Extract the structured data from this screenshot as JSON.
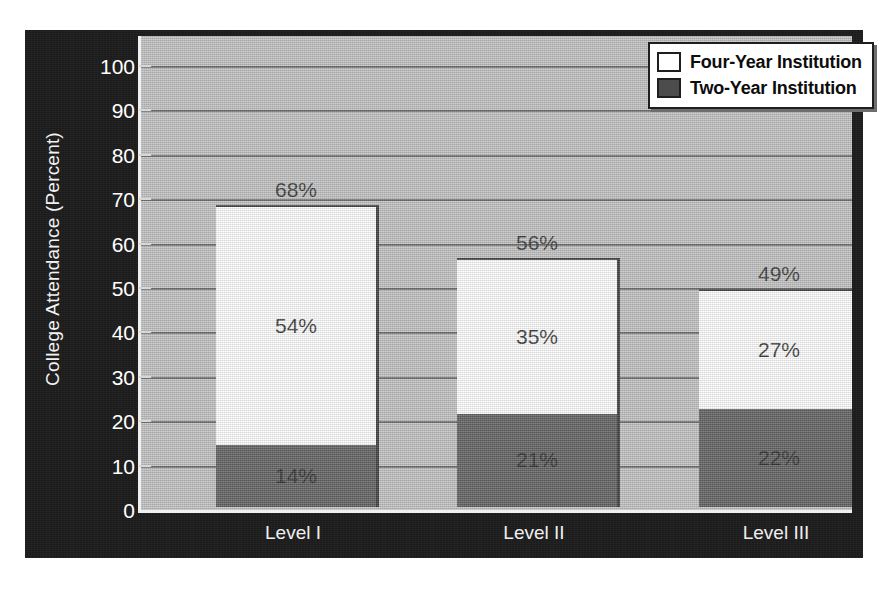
{
  "chart_data": {
    "type": "bar",
    "subtype": "stacked-bar",
    "title": "",
    "xlabel": "",
    "ylabel": "College Attendance (Percent)",
    "categories": [
      "Level I",
      "Level II",
      "Level III"
    ],
    "series": [
      {
        "name": "Two-Year Institution",
        "values": [
          14,
          21,
          22
        ],
        "color": "#4c4c4c",
        "stack_position": "bottom"
      },
      {
        "name": "Four-Year Institution",
        "values": [
          54,
          35,
          27
        ],
        "color": "#ffffff",
        "stack_position": "top"
      }
    ],
    "totals": [
      68,
      56,
      49
    ],
    "value_labels": {
      "totals": [
        "68%",
        "56%",
        "49%"
      ],
      "four_year": [
        "54%",
        "35%",
        "27%"
      ],
      "two_year": [
        "14%",
        "21%",
        "22%"
      ]
    },
    "ylim": [
      0,
      100
    ],
    "ytick_values": [
      0,
      10,
      20,
      30,
      40,
      50,
      60,
      70,
      80,
      90,
      100
    ],
    "ytick_labels": [
      "0",
      "10",
      "20",
      "30",
      "40",
      "50",
      "60",
      "70",
      "80",
      "90",
      "100"
    ],
    "grid": true,
    "grid_axis": "y",
    "legend_position": "top-right"
  },
  "axis": {
    "y_title": "College Attendance (Percent)",
    "y_ticks": [
      "100",
      "90",
      "80",
      "70",
      "60",
      "50",
      "40",
      "30",
      "20",
      "10",
      "0"
    ],
    "x_ticks": [
      "Level I",
      "Level II",
      "Level III"
    ]
  },
  "legend": {
    "items": [
      {
        "label": "Four-Year Institution",
        "swatch": "#ffffff"
      },
      {
        "label": "Two-Year Institution",
        "swatch": "#4c4c4c"
      }
    ]
  },
  "bars": [
    {
      "category": "Level I",
      "total_label": "68%",
      "top_label": "54%",
      "bottom_label": "14%",
      "total": 68,
      "top_value": 54,
      "bottom_value": 14
    },
    {
      "category": "Level II",
      "total_label": "56%",
      "top_label": "35%",
      "bottom_label": "21%",
      "total": 56,
      "top_value": 35,
      "bottom_value": 21
    },
    {
      "category": "Level III",
      "total_label": "49%",
      "top_label": "27%",
      "bottom_label": "22%",
      "total": 49,
      "top_value": 27,
      "bottom_value": 22
    }
  ],
  "colors": {
    "panel_background": "#1b1b1b",
    "plot_background": "#b9b9b9",
    "gridline": "#5d5d5d",
    "two_year_fill": "#4c4c4c",
    "four_year_fill": "#ffffff",
    "tick_text": "#ffffff"
  }
}
